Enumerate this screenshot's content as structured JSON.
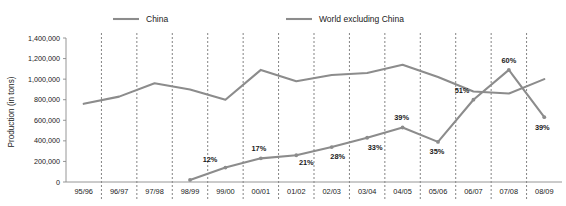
{
  "chart_data": {
    "type": "line",
    "title": "",
    "subtitle": "",
    "xlabel": "",
    "ylabel": "Production (in tons)",
    "categories": [
      "95/96",
      "96/97",
      "97/98",
      "98/99",
      "99/00",
      "00/01",
      "01/02",
      "02/03",
      "03/04",
      "04/05",
      "05/06",
      "06/07",
      "07/08",
      "08/09"
    ],
    "ylim": [
      0,
      1400000
    ],
    "ytick_values": [
      0,
      200000,
      400000,
      600000,
      800000,
      1000000,
      1200000,
      1400000
    ],
    "ytick_labels": [
      "0",
      "200,000",
      "400,000",
      "600,000",
      "800,000",
      "1,000,000",
      "1,200,000",
      "1,400,000"
    ],
    "grid": "vertical-dashed",
    "legend_position": "top",
    "series": [
      {
        "name": "China",
        "color": "#8c8c8c",
        "markers": true,
        "values": [
          null,
          null,
          null,
          20000,
          140000,
          230000,
          260000,
          340000,
          430000,
          530000,
          390000,
          800000,
          1090000,
          630000
        ],
        "point_labels": [
          null,
          null,
          null,
          null,
          "12%",
          "17%",
          "21%",
          "28%",
          "33%",
          "39%",
          "35%",
          "51%",
          "60%",
          "39%"
        ]
      },
      {
        "name": "World excluding China",
        "color": "#8c8c8c",
        "markers": false,
        "values": [
          760000,
          830000,
          960000,
          900000,
          800000,
          1090000,
          980000,
          1040000,
          1060000,
          1140000,
          1020000,
          880000,
          860000,
          1000000
        ],
        "point_labels": [
          null,
          null,
          null,
          null,
          null,
          null,
          null,
          null,
          null,
          null,
          null,
          null,
          null,
          null
        ]
      }
    ]
  },
  "legend": {
    "items": [
      {
        "label": "China",
        "color": "#8c8c8c"
      },
      {
        "label": "World excluding China",
        "color": "#8c8c8c"
      }
    ]
  },
  "colors": {
    "series": "#8c8c8c",
    "grid": "#4d4d4d",
    "axis": "#8a8a8a",
    "text": "#1a1a1a",
    "background": "#ffffff"
  }
}
